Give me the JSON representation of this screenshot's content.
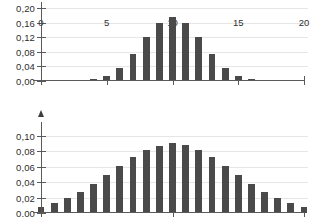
{
  "chart_data": [
    {
      "id": "top",
      "type": "bar",
      "title": "",
      "xlabel": "",
      "ylabel": "",
      "categories": [
        0,
        1,
        2,
        3,
        4,
        5,
        6,
        7,
        8,
        9,
        10,
        11,
        12,
        13,
        14,
        15,
        16,
        17,
        18,
        19,
        20
      ],
      "values": [
        0.0,
        0.0,
        0.0,
        0.001,
        0.005,
        0.015,
        0.037,
        0.074,
        0.12,
        0.16,
        0.176,
        0.16,
        0.12,
        0.074,
        0.037,
        0.015,
        0.005,
        0.001,
        0.0,
        0.0,
        0.0
      ],
      "ylim": [
        0,
        0.2
      ],
      "xlim": [
        0,
        20
      ],
      "yticks": [
        0.0,
        0.04,
        0.08,
        0.12,
        0.16,
        0.2
      ],
      "ytick_labels": [
        "0,00",
        "0,04",
        "0,08",
        "0,12",
        "0,16",
        "0,20"
      ],
      "xticks": [
        0,
        5,
        10,
        15,
        20
      ],
      "xtick_labels": [
        "0",
        "5",
        "10",
        "15",
        "20"
      ],
      "grid": true,
      "bar_color": "#4a4a4a"
    },
    {
      "id": "bottom",
      "type": "bar",
      "title": "",
      "xlabel": "",
      "ylabel": "",
      "categories": [
        0,
        1,
        2,
        3,
        4,
        5,
        6,
        7,
        8,
        9,
        10,
        11,
        12,
        13,
        14,
        15,
        16,
        17,
        18,
        19,
        20,
        21,
        22
      ],
      "values": [
        0.008,
        0.013,
        0.019,
        0.027,
        0.037,
        0.049,
        0.061,
        0.072,
        0.081,
        0.087,
        0.09,
        0.088,
        0.082,
        0.072,
        0.061,
        0.049,
        0.037,
        0.027,
        0.019,
        0.013,
        0.008,
        0.0,
        0.0
      ],
      "ylim": [
        0,
        0.11
      ],
      "xlim": [
        0,
        20
      ],
      "yticks": [
        0.0,
        0.02,
        0.04,
        0.06,
        0.08,
        0.1
      ],
      "ytick_labels": [
        "0,00",
        "0,02",
        "0,04",
        "0,06",
        "0,08",
        "0,10"
      ],
      "xticks": [
        0,
        10,
        20
      ],
      "xtick_labels": [
        "",
        "",
        ""
      ],
      "grid": true,
      "bar_color": "#4a4a4a"
    }
  ],
  "page": {
    "background": "#ffffff",
    "axis_color": "#5a5a5a",
    "grid_color": "#e6e6e6",
    "text_color": "#2e2e2e"
  }
}
